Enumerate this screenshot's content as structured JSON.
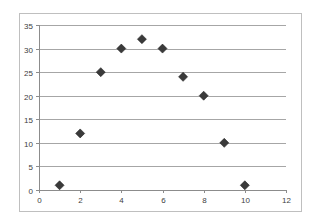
{
  "chart_data": {
    "type": "scatter",
    "title": "",
    "xlabel": "",
    "ylabel": "",
    "x": [
      1,
      2,
      3,
      4,
      5,
      6,
      7,
      8,
      9,
      10
    ],
    "series": [
      {
        "name": "Series1",
        "values": [
          1,
          12,
          25,
          30,
          32,
          30,
          24,
          20,
          10,
          1
        ],
        "marker": "diamond",
        "color": "#3a3a3a"
      }
    ],
    "xlim": [
      0,
      12
    ],
    "ylim": [
      0,
      35
    ],
    "x_ticks": [
      0,
      2,
      4,
      6,
      8,
      10,
      12
    ],
    "y_ticks": [
      0,
      5,
      10,
      15,
      20,
      25,
      30,
      35
    ],
    "grid": {
      "horizontal": true,
      "vertical": false
    },
    "legend": "none"
  },
  "colors": {
    "marker": "#3a3a3a",
    "gridline": "#a6a6a6",
    "axis": "#8c8c8c",
    "border": "#bfbfbf",
    "tick_label": "#404040"
  }
}
